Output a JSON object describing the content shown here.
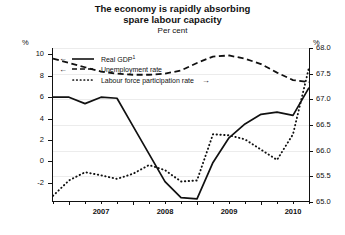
{
  "header": {
    "title_line1": "The economy is rapidly absorbing",
    "title_line2": "spare labour capacity",
    "subtitle": "Per cent"
  },
  "axes": {
    "left_unit": "%",
    "right_unit": "%",
    "left_ticks": [
      "10",
      "8",
      "6",
      "4",
      "2",
      "0",
      "-2"
    ],
    "right_ticks": [
      "68.0",
      "67.5",
      "67.0",
      "66.5",
      "66.0",
      "65.5",
      "65.0"
    ],
    "x_ticks": [
      "2007",
      "2008",
      "2009",
      "2010"
    ]
  },
  "legend": {
    "items": [
      {
        "label": "Real GDP",
        "superscript": "1",
        "style": "solid",
        "arrow": "left",
        "axis": "left"
      },
      {
        "label": "Unemployment rate",
        "superscript": "",
        "style": "dashed",
        "arrow": "left",
        "axis": "left"
      },
      {
        "label": "Labour force participation rate",
        "superscript": "",
        "style": "dotted",
        "arrow": "right",
        "axis": "right"
      }
    ],
    "arrow_left_glyph": "←",
    "arrow_right_glyph": "→"
  },
  "chart_data": {
    "type": "line",
    "title": "The economy is rapidly absorbing spare labour capacity",
    "subtitle": "Per cent",
    "xlabel": "",
    "ylabel": "Per cent",
    "grid": true,
    "legend_position": "top-left",
    "x": [
      "2006Q4",
      "2007Q1",
      "2007Q2",
      "2007Q3",
      "2007Q4",
      "2008Q1",
      "2008Q2",
      "2008Q3",
      "2008Q4",
      "2009Q1",
      "2009Q2",
      "2009Q3",
      "2009Q4",
      "2010Q1",
      "2010Q2",
      "2010Q3",
      "2010Q4"
    ],
    "left_axis": {
      "label": "%",
      "ylim": [
        -3.8,
        10.6
      ],
      "ticks": [
        -2,
        0,
        2,
        4,
        6,
        8,
        10
      ]
    },
    "right_axis": {
      "label": "%",
      "ylim": [
        65.0,
        68.0
      ],
      "ticks": [
        65.0,
        65.5,
        66.0,
        66.5,
        67.0,
        67.5,
        68.0
      ]
    },
    "series": [
      {
        "name": "Real GDP",
        "axis": "left",
        "style": "solid",
        "color": "#111111",
        "values": [
          6.0,
          6.0,
          5.4,
          6.0,
          5.9,
          3.3,
          0.7,
          -1.9,
          -3.4,
          -3.5,
          -0.1,
          2.2,
          3.5,
          4.4,
          4.6,
          4.3,
          6.9
        ]
      },
      {
        "name": "Unemployment rate",
        "axis": "left",
        "style": "dashed",
        "color": "#111111",
        "values": [
          9.6,
          9.2,
          8.8,
          8.4,
          8.2,
          8.1,
          8.1,
          8.2,
          8.5,
          9.2,
          9.8,
          9.9,
          9.6,
          9.1,
          8.3,
          7.6,
          7.4
        ]
      },
      {
        "name": "Labour force participation rate",
        "axis": "right",
        "style": "dotted",
        "color": "#111111",
        "values": [
          65.12,
          65.42,
          65.58,
          65.52,
          65.45,
          65.55,
          65.72,
          65.62,
          65.4,
          65.42,
          66.32,
          66.3,
          66.22,
          66.02,
          65.82,
          66.32,
          67.62
        ]
      }
    ]
  }
}
